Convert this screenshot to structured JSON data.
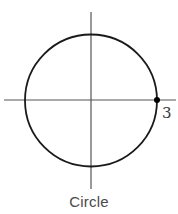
{
  "figure": {
    "caption": "Circle",
    "shape": "circle",
    "center": [
      0,
      0
    ],
    "radius": 3,
    "marked_point": {
      "x": 3,
      "y": 0,
      "label": "3"
    },
    "axes": {
      "x_axis": true,
      "y_axis": true
    }
  },
  "colors": {
    "stroke": "#1a1a1a",
    "axis": "#4a4a4a",
    "text": "#4a4a4a"
  }
}
